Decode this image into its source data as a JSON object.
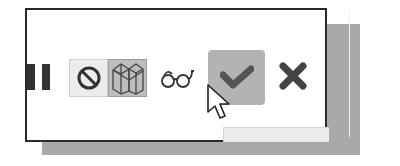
{
  "toolbar": {
    "buttons": [
      {
        "id": "hide",
        "label": "Hide/Show",
        "icon": "prohibit-icon",
        "state": "normal"
      },
      {
        "id": "shaded",
        "label": "Shaded display",
        "icon": "shaded-box-icon",
        "state": "pressed"
      },
      {
        "id": "preview",
        "label": "Preview",
        "icon": "eyeglasses-icon",
        "state": "normal"
      },
      {
        "id": "ok",
        "label": "OK",
        "icon": "checkmark-icon",
        "state": "hover"
      },
      {
        "id": "cancel",
        "label": "Cancel",
        "icon": "x-icon",
        "state": "normal"
      }
    ]
  },
  "cursor": {
    "icon": "arrow-cursor-icon",
    "over": "ok"
  },
  "colors": {
    "frame_border": "#2a2a2a",
    "shadow": "#a9a9a9",
    "pressed_bg": "#bdbdbd",
    "hover_bg": "#b3b3b3",
    "icon_dark": "#3a3a3a"
  }
}
